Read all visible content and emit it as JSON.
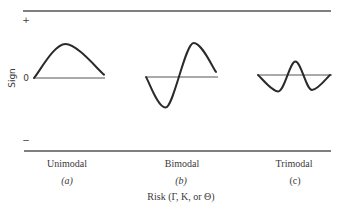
{
  "chart_data": {
    "type": "line",
    "title": "",
    "ylabel": "Sign",
    "xlabel": "Risk (Γ, K, or Θ)",
    "y_ticks": [
      "+",
      "0",
      "−"
    ],
    "grid": false,
    "panels": [
      {
        "name": "Unimodal",
        "tag": "(a)",
        "tag_italic": true,
        "description": "single positive hump",
        "points": [
          [
            0,
            0
          ],
          [
            0.45,
            1
          ],
          [
            1,
            0.1
          ]
        ]
      },
      {
        "name": "Bimodal",
        "tag": "(b)",
        "tag_italic": true,
        "description": "negative trough then positive peak",
        "points": [
          [
            0,
            0
          ],
          [
            0.28,
            -0.9
          ],
          [
            0.68,
            1
          ],
          [
            1,
            0.15
          ]
        ]
      },
      {
        "name": "Trimodal",
        "tag": "(c)",
        "tag_italic": false,
        "description": "trough, peak, trough",
        "points": [
          [
            0,
            0
          ],
          [
            0.28,
            -0.55
          ],
          [
            0.52,
            0.45
          ],
          [
            0.75,
            -0.5
          ],
          [
            1,
            0
          ]
        ]
      }
    ]
  }
}
